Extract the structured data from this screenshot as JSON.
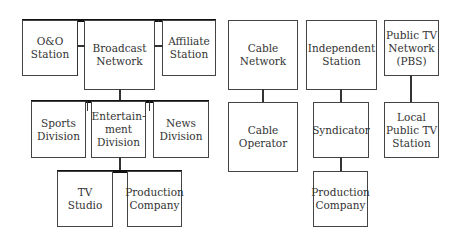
{
  "broadcast": {
    "oo_station": "O&O\nStation",
    "network": "Broadcast\nNetwork",
    "affiliate": "Affiliate\nStation",
    "sports": "Sports\nDivision",
    "entertainment": "Entertain-\nment\nDivision",
    "news": "News\nDivision",
    "tv_studio": "TV\nStudio",
    "production": "Production\nCompany"
  },
  "cable": {
    "network": "Cable\nNetwork",
    "operator": "Cable\nOperator"
  },
  "independent": {
    "station": "Independent\nStation",
    "syndicator": "Syndicator",
    "production": "Production\nCompany"
  },
  "public_tv": {
    "network": "Public TV\nNetwork\n(PBS)",
    "local": "Local\nPublic TV\nStation"
  }
}
